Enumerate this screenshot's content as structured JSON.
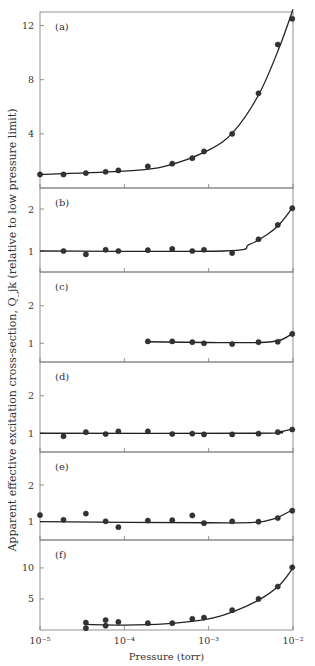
{
  "chart_data": {
    "type": "scatter",
    "x_scale": "log",
    "xlabel": "Pressure (torr)",
    "ylabel": "Apparent effective excitation cross-section, Q_jk (relative to low pressure limit)",
    "x_ticks": [
      1e-05,
      0.0001,
      0.001,
      0.01
    ],
    "x_tick_labels": [
      "10⁻⁵",
      "10⁻⁴",
      "10⁻³",
      "10⁻²"
    ],
    "xlim": [
      1e-05,
      0.01
    ],
    "grid": false,
    "panels": [
      {
        "label": "(a)",
        "ylim": [
          0,
          13
        ],
        "y_ticks": [
          4,
          8,
          12
        ],
        "y_tick_labels": [
          "4",
          "8",
          "12"
        ],
        "points": [
          [
            1e-05,
            1.0
          ],
          [
            1.9e-05,
            1.0
          ],
          [
            3.5e-05,
            1.1
          ],
          [
            6e-05,
            1.2
          ],
          [
            8.5e-05,
            1.3
          ],
          [
            0.00019,
            1.6
          ],
          [
            0.00037,
            1.8
          ],
          [
            0.00064,
            2.2
          ],
          [
            0.00088,
            2.7
          ],
          [
            0.0019,
            4.0
          ],
          [
            0.0039,
            7.0
          ],
          [
            0.0066,
            10.6
          ],
          [
            0.0098,
            12.5
          ]
        ],
        "curve": [
          [
            1e-05,
            1.0
          ],
          [
            0.0001,
            1.25
          ],
          [
            0.0003,
            1.6
          ],
          [
            0.001,
            2.8
          ],
          [
            0.002,
            4.2
          ],
          [
            0.004,
            7.0
          ],
          [
            0.007,
            10.5
          ],
          [
            0.01,
            13.2
          ]
        ]
      },
      {
        "label": "(b)",
        "ylim": [
          0.5,
          2.5
        ],
        "y_ticks": [
          1,
          2
        ],
        "y_tick_labels": [
          "1",
          "2"
        ],
        "points": [
          [
            1.9e-05,
            1.0
          ],
          [
            3.5e-05,
            0.92
          ],
          [
            6e-05,
            1.03
          ],
          [
            8.5e-05,
            1.0
          ],
          [
            0.00019,
            1.02
          ],
          [
            0.00037,
            1.05
          ],
          [
            0.00064,
            1.0
          ],
          [
            0.00088,
            1.03
          ],
          [
            0.0019,
            0.95
          ],
          [
            0.0039,
            1.28
          ],
          [
            0.0066,
            1.62
          ],
          [
            0.0098,
            2.02
          ]
        ],
        "curve": [
          [
            1e-05,
            1.0
          ],
          [
            0.0015,
            1.0
          ],
          [
            0.003,
            1.15
          ],
          [
            0.005,
            1.4
          ],
          [
            0.007,
            1.65
          ],
          [
            0.01,
            2.05
          ]
        ]
      },
      {
        "label": "(c)",
        "ylim": [
          0.5,
          2.9
        ],
        "y_ticks": [
          1,
          2
        ],
        "y_tick_labels": [
          "1",
          "2"
        ],
        "points": [
          [
            0.00019,
            1.05
          ],
          [
            0.00037,
            1.05
          ],
          [
            0.00064,
            1.03
          ],
          [
            0.00088,
            1.0
          ],
          [
            0.0019,
            0.98
          ],
          [
            0.0039,
            1.03
          ],
          [
            0.0066,
            1.04
          ],
          [
            0.0098,
            1.25
          ]
        ],
        "curve": [
          [
            0.00019,
            1.04
          ],
          [
            0.001,
            1.02
          ],
          [
            0.004,
            1.02
          ],
          [
            0.007,
            1.08
          ],
          [
            0.01,
            1.27
          ]
        ]
      },
      {
        "label": "(d)",
        "ylim": [
          0.5,
          2.9
        ],
        "y_ticks": [
          1,
          2
        ],
        "y_tick_labels": [
          "1",
          "2"
        ],
        "points": [
          [
            1.9e-05,
            0.92
          ],
          [
            3.5e-05,
            1.03
          ],
          [
            6e-05,
            0.98
          ],
          [
            8.5e-05,
            1.05
          ],
          [
            0.00019,
            1.05
          ],
          [
            0.00037,
            0.98
          ],
          [
            0.00064,
            0.99
          ],
          [
            0.00088,
            0.97
          ],
          [
            0.0019,
            0.97
          ],
          [
            0.0039,
            0.99
          ],
          [
            0.0066,
            1.03
          ],
          [
            0.0098,
            1.1
          ]
        ],
        "curve": [
          [
            1e-05,
            1.0
          ],
          [
            0.004,
            1.0
          ],
          [
            0.007,
            1.04
          ],
          [
            0.01,
            1.12
          ]
        ]
      },
      {
        "label": "(e)",
        "ylim": [
          0.5,
          2.9
        ],
        "y_ticks": [
          1,
          2
        ],
        "y_tick_labels": [
          "1",
          "2"
        ],
        "points": [
          [
            1e-05,
            1.18
          ],
          [
            1.9e-05,
            1.05
          ],
          [
            3.5e-05,
            1.22
          ],
          [
            6e-05,
            1.01
          ],
          [
            8.5e-05,
            0.85
          ],
          [
            0.00019,
            1.03
          ],
          [
            0.00037,
            1.04
          ],
          [
            0.00064,
            1.17
          ],
          [
            0.00088,
            0.96
          ],
          [
            0.0019,
            1.01
          ],
          [
            0.0039,
            1.0
          ],
          [
            0.0066,
            1.1
          ],
          [
            0.0098,
            1.3
          ]
        ],
        "curve": [
          [
            1e-05,
            1.0
          ],
          [
            0.001,
            0.97
          ],
          [
            0.0035,
            0.98
          ],
          [
            0.006,
            1.08
          ],
          [
            0.01,
            1.33
          ]
        ]
      },
      {
        "label": "(f)",
        "ylim": [
          0,
          14.5
        ],
        "y_ticks": [
          5,
          10
        ],
        "y_tick_labels": [
          "5",
          "10"
        ],
        "points": [
          [
            3.5e-05,
            1.2
          ],
          [
            3.5e-05,
            0.3
          ],
          [
            6e-05,
            1.6
          ],
          [
            6e-05,
            0.7
          ],
          [
            8.5e-05,
            1.3
          ],
          [
            0.00019,
            1.1
          ],
          [
            0.00037,
            1.1
          ],
          [
            0.00064,
            1.8
          ],
          [
            0.00088,
            2.0
          ],
          [
            0.0019,
            3.2
          ],
          [
            0.0039,
            5.0
          ],
          [
            0.0066,
            7.0
          ],
          [
            0.0098,
            10.1
          ]
        ],
        "curve": [
          [
            3.5e-05,
            0.9
          ],
          [
            0.0001,
            0.8
          ],
          [
            0.0003,
            1.0
          ],
          [
            0.001,
            1.8
          ],
          [
            0.002,
            3.0
          ],
          [
            0.004,
            4.9
          ],
          [
            0.007,
            7.3
          ],
          [
            0.01,
            10.0
          ]
        ]
      }
    ]
  }
}
